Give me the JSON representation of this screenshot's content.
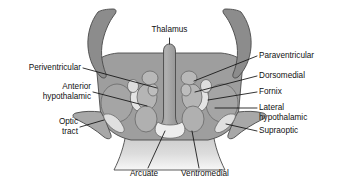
{
  "figure": {
    "background_color": "#ffffff"
  },
  "colors": {
    "thalamus_fill": "#8c8c8c",
    "hypothalamus_fill": "#9e9e9e",
    "lateral_wing_fill": "#a8a8a8",
    "nucleus_mid_fill": "#b5b5b5",
    "nucleus_light_fill": "#d9d9d9",
    "nucleus_pale_fill": "#e8e8e8",
    "ventricle_fill": "#a0a0a0",
    "stalk_fill": "#cfcfcf",
    "outline_stroke": "#4a4a4a",
    "nucleus_stroke": "#6b6b6b",
    "leader_stroke": "#111111",
    "label_text": "#111111"
  },
  "labels": {
    "thalamus": "Thalamus",
    "periventricular": "Periventricular",
    "anterior_hypothalamic_line1": "Anterior",
    "anterior_hypothalamic_line2": "hypothalamic",
    "optic_tract_line1": "Optic",
    "optic_tract_line2": "tract",
    "paraventricular": "Paraventricular",
    "dorsomedial": "Dorsomedial",
    "fornix": "Fornix",
    "lateral_hypothalamic_line1": "Lateral",
    "lateral_hypothalamic_line2": "hypothalamic",
    "supraoptic": "Supraoptic",
    "arcuate": "Arcuate",
    "ventromedial": "Ventromedial"
  }
}
